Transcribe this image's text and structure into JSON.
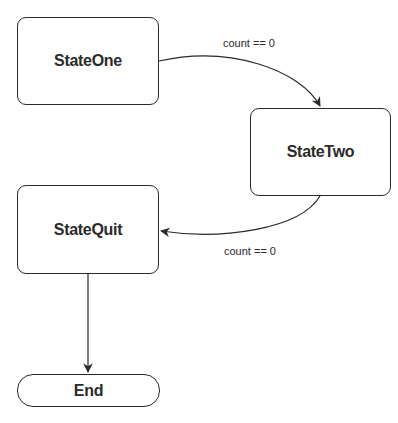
{
  "diagram": {
    "type": "state-machine",
    "nodes": [
      {
        "id": "state_one",
        "label": "StateOne",
        "shape": "rounded-rect"
      },
      {
        "id": "state_two",
        "label": "StateTwo",
        "shape": "rounded-rect"
      },
      {
        "id": "state_quit",
        "label": "StateQuit",
        "shape": "rounded-rect"
      },
      {
        "id": "end",
        "label": "End",
        "shape": "terminal-pill"
      }
    ],
    "edges": [
      {
        "from": "StateOne",
        "to": "StateTwo",
        "label": "count == 0"
      },
      {
        "from": "StateTwo",
        "to": "StateQuit",
        "label": "count == 0"
      },
      {
        "from": "StateQuit",
        "to": "End",
        "label": ""
      }
    ]
  },
  "colors": {
    "stroke": "#2a2a2a",
    "text": "#2b2b2b",
    "background": "#ffffff"
  }
}
